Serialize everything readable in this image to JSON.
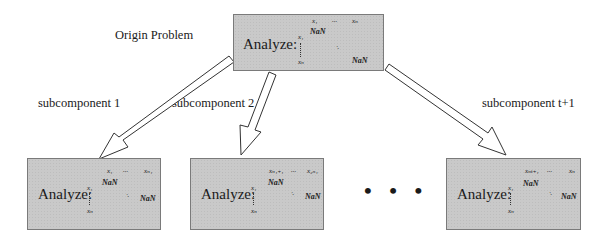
{
  "title_label": "Origin Problem",
  "analyze_label": "Analyze:",
  "nan": "NaN",
  "ellipsis_h": "...",
  "ellipsis_d": "·.",
  "ellipsis_nodes": "• • •",
  "colors": {
    "box_fill": "#c9c9c9",
    "box_border": "#7a7a7a",
    "arrow_fill": "#ffffff",
    "arrow_stroke": "#333333"
  },
  "origin_box": {
    "row_first": "x₁",
    "row_last": "xₙ",
    "col_first": "x₁",
    "col_last": "xₙ"
  },
  "subcomponents": [
    {
      "label": "subcomponent 1",
      "row_first": "x₁",
      "row_last": "xₙ₁",
      "col_first": "x₁",
      "col_last": "xₙ"
    },
    {
      "label": "subcomponent 2",
      "row_first": "xₙ₁₊₁",
      "row_last": "x₂ₙ₁",
      "col_first": "x₁",
      "col_last": "xₙ"
    },
    {
      "label": "subcomponent t+1",
      "row_first": "xₙₜ₊₁",
      "row_last": "xₙ",
      "col_first": "x₁",
      "col_last": "xₙ"
    }
  ]
}
